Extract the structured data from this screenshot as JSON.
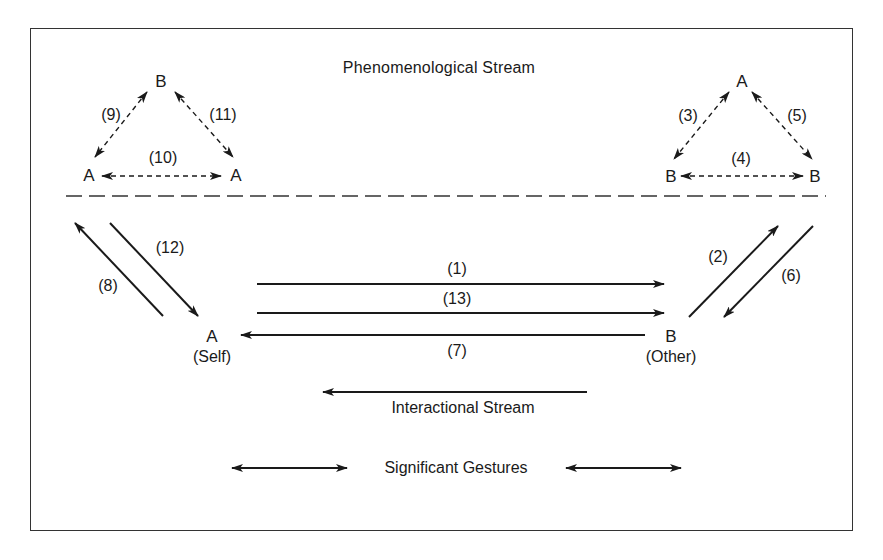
{
  "diagram": {
    "title": "Phenomenological Stream",
    "nodes": {
      "left_triangle": {
        "top": "B",
        "bottom_left": "A",
        "bottom_right": "A"
      },
      "right_triangle": {
        "top": "A",
        "bottom_left": "B",
        "bottom_right": "B"
      },
      "self": {
        "letter": "A",
        "caption": "(Self)"
      },
      "other": {
        "letter": "B",
        "caption": "(Other)"
      }
    },
    "edge_labels": {
      "e1": "(1)",
      "e2": "(2)",
      "e3": "(3)",
      "e4": "(4)",
      "e5": "(5)",
      "e6": "(6)",
      "e7": "(7)",
      "e8": "(8)",
      "e9": "(9)",
      "e10": "(10)",
      "e11": "(11)",
      "e12": "(12)",
      "e13": "(13)"
    },
    "legend": {
      "interactional": "Interactional Stream",
      "gestures": "Significant Gestures"
    },
    "colors": {
      "ink": "#1a1a1a",
      "background": "#ffffff"
    }
  }
}
